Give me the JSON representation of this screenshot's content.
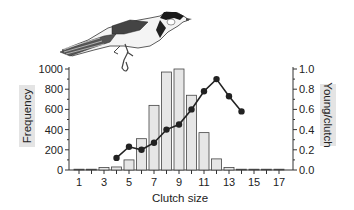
{
  "chart_data": {
    "type": "bar",
    "title": "",
    "xlabel": "Clutch size",
    "ylabel": "Frequency",
    "ylabel_right": "Young/clutch",
    "categories": [
      1,
      2,
      3,
      4,
      5,
      6,
      7,
      8,
      9,
      10,
      11,
      12,
      13,
      14,
      15,
      16,
      17
    ],
    "x_tick_labels": [
      "1",
      "3",
      "5",
      "7",
      "9",
      "11",
      "13",
      "15",
      "17"
    ],
    "ylim": [
      0,
      1000
    ],
    "y_ticks": [
      "0",
      "200",
      "400",
      "600",
      "800",
      "1000"
    ],
    "ylim_right": [
      0,
      1.0
    ],
    "y_ticks_right": [
      "0.0",
      "0.2",
      "0.4",
      "0.6",
      "0.8",
      "1.0"
    ],
    "grid": false,
    "series": [
      {
        "name": "Frequency",
        "type": "bar",
        "axis": "left",
        "color": "#e6e6e6",
        "values": [
          3,
          3,
          25,
          30,
          100,
          310,
          640,
          970,
          1000,
          740,
          370,
          110,
          25,
          5,
          5,
          0,
          5
        ]
      },
      {
        "name": "Young/clutch",
        "type": "line",
        "axis": "right",
        "color": "#222222",
        "x": [
          4,
          5,
          6,
          7,
          8,
          9,
          10,
          11,
          12,
          13,
          14
        ],
        "values": [
          0.12,
          0.23,
          0.2,
          0.27,
          0.4,
          0.45,
          0.6,
          0.78,
          0.9,
          0.73,
          0.58
        ]
      }
    ],
    "annotations": [
      "Illustration of a great tit (bird) above the plot"
    ]
  },
  "labels": {
    "xlabel": "Clutch size",
    "ylabel": "Frequency",
    "ylabel_right": "Young/clutch"
  }
}
